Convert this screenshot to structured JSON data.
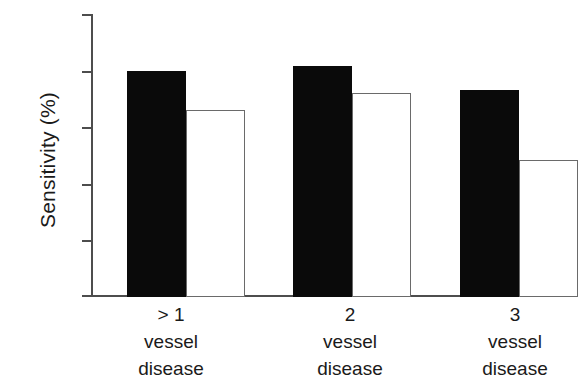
{
  "chart_data": {
    "type": "bar",
    "title": "",
    "subtitle": "",
    "xlabel": "",
    "ylabel": "Sensitivity (%)",
    "ylim": [
      0,
      100
    ],
    "yticks": [
      0,
      20,
      40,
      60,
      80,
      100
    ],
    "ytick_labels": [
      "0",
      "20",
      "40",
      "60",
      "80",
      "100"
    ],
    "grid": false,
    "legend": "none",
    "categories": [
      "> 1\nvessel\ndisease",
      "2\nvessel\ndisease",
      "3\nvessel\ndisease"
    ],
    "category_lines": [
      [
        "> 1",
        "vessel",
        "disease"
      ],
      [
        "2",
        "vessel",
        "disease"
      ],
      [
        "3",
        "vessel",
        "disease"
      ]
    ],
    "series": [
      {
        "name": "filled",
        "style": "solid-black",
        "color": "#0a0a0a",
        "values": [
          80,
          81.5,
          73
        ]
      },
      {
        "name": "open",
        "style": "open-white",
        "color": "#ffffff",
        "edge_color": "#6a6a6a",
        "values": [
          66,
          72,
          48.5
        ]
      }
    ]
  },
  "axis": {
    "y_title": "Sensitivity (%)",
    "y_tick_0": "0",
    "y_tick_1": "20",
    "y_tick_2": "40",
    "y_tick_3": "60",
    "y_tick_4": "80",
    "y_tick_5": "100"
  },
  "categories_text": {
    "g1_l1": "> 1",
    "g1_l2": "vessel",
    "g1_l3": "disease",
    "g2_l1": "2",
    "g2_l2": "vessel",
    "g2_l3": "disease",
    "g3_l1": "3",
    "g3_l2": "vessel",
    "g3_l3": "disease"
  },
  "colors": {
    "filled_bar": "#0a0a0a",
    "open_bar_fill": "#ffffff",
    "open_bar_edge": "#6a6a6a",
    "axis": "#4d4d4d",
    "text": "#1a1a1a",
    "background": "#ffffff"
  }
}
